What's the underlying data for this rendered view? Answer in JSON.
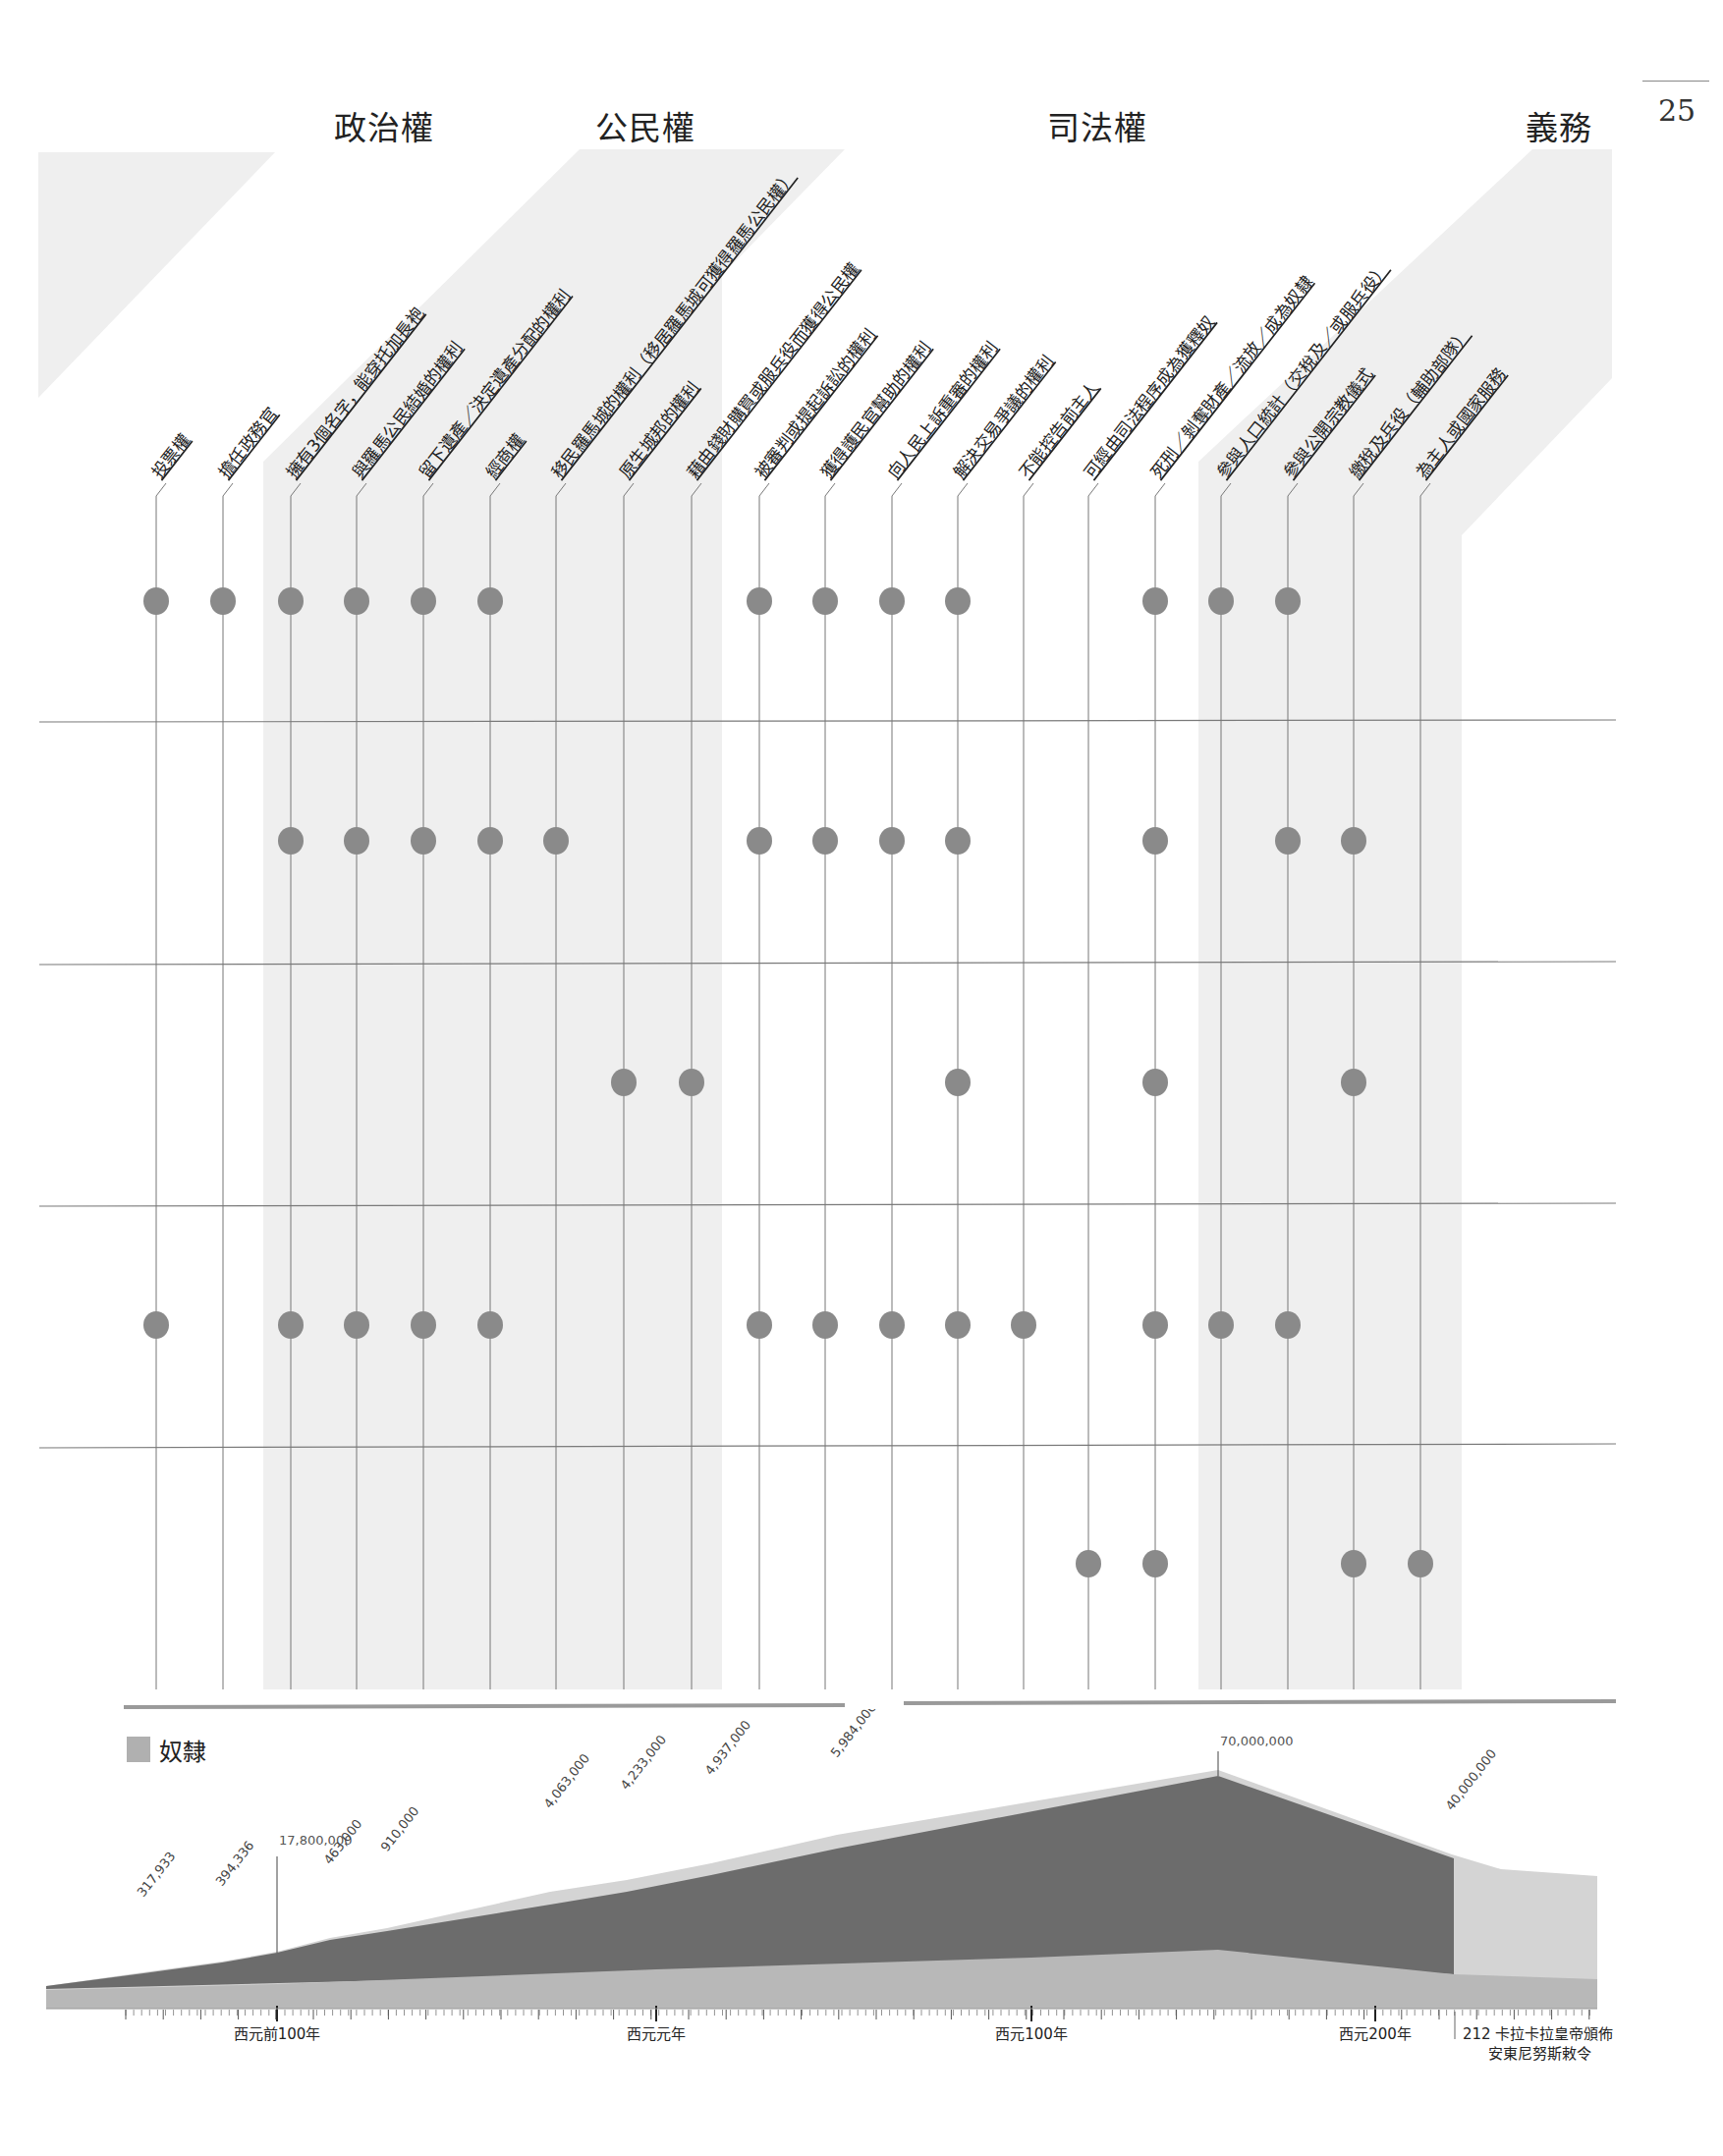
{
  "page_number": "25",
  "categories": [
    {
      "label": "政治權",
      "x": 340
    },
    {
      "label": "公民權",
      "x": 606
    },
    {
      "label": "司法權",
      "x": 1066
    },
    {
      "label": "義務",
      "x": 1553
    }
  ],
  "columns": [
    {
      "label": "投票權",
      "x": 159
    },
    {
      "label": "擔任政務官",
      "x": 227
    },
    {
      "label": "擁有3個名字，能穿托加長袍",
      "x": 296
    },
    {
      "label": "與羅馬公民結婚的權利",
      "x": 363
    },
    {
      "label": "留下遺產／決定遺產分配的權利",
      "x": 431
    },
    {
      "label": "經商權",
      "x": 499
    },
    {
      "label": "移民羅馬城的權利（移居羅馬城可獲得羅馬公民權）",
      "x": 566
    },
    {
      "label": "原生城邦的權利",
      "x": 635
    },
    {
      "label": "藉由錢財購買或服兵役而獲得公民權",
      "x": 704
    },
    {
      "label": "被審判或提起訴訟的權利",
      "x": 773
    },
    {
      "label": "獲得護民官幫助的權利",
      "x": 840
    },
    {
      "label": "向人民上訴重審的權利",
      "x": 908
    },
    {
      "label": "解決交易爭議的權利",
      "x": 975
    },
    {
      "label": "不能控告前主人",
      "x": 1042
    },
    {
      "label": "可經由司法程序成為獲釋奴",
      "x": 1108
    },
    {
      "label": "死刑／剝奪財產／流放／成為奴隸",
      "x": 1176
    },
    {
      "label": "參與人口統計（交稅及／或服兵役）",
      "x": 1243
    },
    {
      "label": "參與公開宗教儀式",
      "x": 1311
    },
    {
      "label": "繳稅及兵役（輔助部隊）",
      "x": 1378
    },
    {
      "label": "為主人或國家服務",
      "x": 1446
    }
  ],
  "legend": {
    "label": "奴隸",
    "swatch_color": "#b0b0b0"
  },
  "colors": {
    "dot": "#8a8a8a",
    "band": "#efefef",
    "dark_area": "#6c6c6c",
    "light_area": "#d4d4d4",
    "base_area": "#b8b8b8"
  },
  "chart_data": [
    {
      "type": "table",
      "title": "權利與義務矩陣",
      "group_headers": [
        "政治權",
        "公民權",
        "司法權",
        "義務"
      ],
      "columns": [
        "投票權",
        "擔任政務官",
        "擁有3個名字，能穿托加長袍",
        "與羅馬公民結婚的權利",
        "留下遺產／決定遺產分配的權利",
        "經商權",
        "移民羅馬城的權利（移居羅馬城可獲得羅馬公民權）",
        "原生城邦的權利",
        "藉由錢財購買或服兵役而獲得公民權",
        "被審判或提起訴訟的權利",
        "獲得護民官幫助的權利",
        "向人民上訴重審的權利",
        "解決交易爭議的權利",
        "不能控告前主人",
        "可經由司法程序成為獲釋奴",
        "死刑／剝奪財產／流放／成為奴隸",
        "參與人口統計（交稅及／或服兵役）",
        "參與公開宗教儀式",
        "繳稅及兵役（輔助部隊）",
        "為主人或國家服務"
      ],
      "rows": [
        {
          "y": 612,
          "dots": [
            0,
            1,
            2,
            3,
            4,
            5,
            9,
            10,
            11,
            12,
            15,
            16,
            17
          ]
        },
        {
          "y": 856,
          "dots": [
            2,
            3,
            4,
            5,
            6,
            9,
            10,
            11,
            12,
            15,
            17,
            18
          ]
        },
        {
          "y": 1102,
          "dots": [
            7,
            8,
            12,
            15,
            18
          ]
        },
        {
          "y": 1349,
          "dots": [
            0,
            2,
            3,
            4,
            5,
            9,
            10,
            11,
            12,
            13,
            15,
            16,
            17
          ]
        },
        {
          "y": 1592,
          "dots": [
            14,
            15,
            18,
            19
          ]
        }
      ]
    },
    {
      "type": "area",
      "title": "奴隸",
      "legend": [
        "奴隸"
      ],
      "xlabel": "",
      "ylabel": "",
      "x_ticks": [
        {
          "label": "西元前100年",
          "x": 282
        },
        {
          "label": "西元元年",
          "x": 668
        },
        {
          "label": "西元100年",
          "x": 1050
        },
        {
          "label": "西元200年",
          "x": 1400
        }
      ],
      "event": {
        "year": "212",
        "text_line1": "212  卡拉卡拉皇帝頒佈",
        "text_line2": "安東尼努斯敕令",
        "x": 1483
      },
      "annotations": [
        {
          "label": "317,933",
          "x": 146,
          "y": 1932
        },
        {
          "label": "394,336",
          "x": 226,
          "y": 1921
        },
        {
          "label": "17,800,000",
          "x": 282,
          "y": 1880,
          "leader": true
        },
        {
          "label": "463,000",
          "x": 336,
          "y": 1899
        },
        {
          "label": "910,000",
          "x": 394,
          "y": 1886
        },
        {
          "label": "4,063,000",
          "x": 560,
          "y": 1842
        },
        {
          "label": "4,233,000",
          "x": 638,
          "y": 1823
        },
        {
          "label": "4,937,000",
          "x": 724,
          "y": 1808
        },
        {
          "label": "5,984,000",
          "x": 852,
          "y": 1790
        },
        {
          "label": "70,000,000",
          "x": 1240,
          "y": 1777,
          "leader": true
        },
        {
          "label": "40,000,000",
          "x": 1478,
          "y": 1844
        }
      ],
      "series": [
        {
          "name": "總人口（淺灰上層）",
          "values": [
            317933,
            394336,
            17800000,
            463000,
            910000,
            4063000,
            4233000,
            4937000,
            5984000,
            70000000,
            40000000
          ]
        }
      ]
    }
  ]
}
